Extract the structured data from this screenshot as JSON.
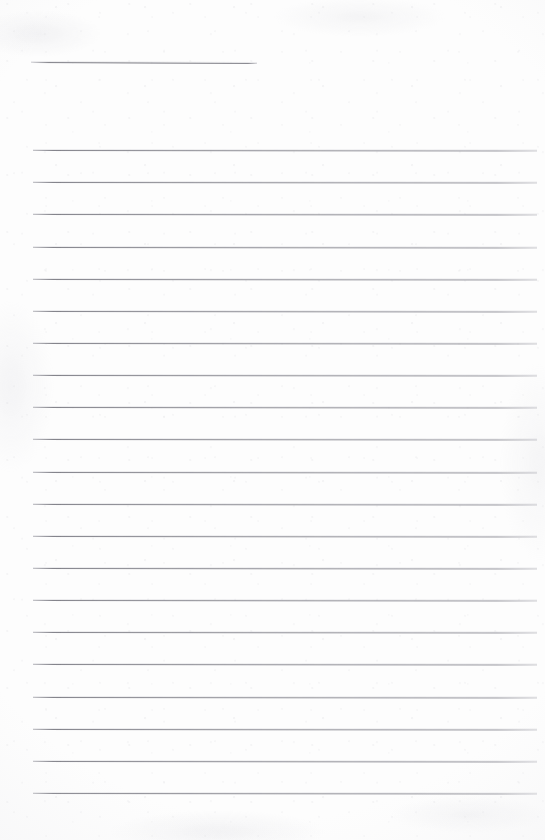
{
  "document": {
    "kind": "lined-paper-sheet",
    "title": "",
    "page_width": 545,
    "page_height": 840,
    "background_color": "#fdfdfd",
    "rule_color": "#85858d",
    "has_text_content": false,
    "note": ""
  },
  "layout": {
    "left_margin_x": 33,
    "right_margin_x": 537,
    "line_spacing": 32.15,
    "first_ruled_line_y": 150,
    "last_ruled_line_y": 793,
    "ruled_line_count": 21
  },
  "header_rule": {
    "label": "name-line",
    "x": 31,
    "y": 62,
    "width": 226,
    "tilt_degrees": 0.26
  },
  "ruled_lines": [
    {
      "index": 1,
      "y": 150.0,
      "x": 33,
      "width": 504
    },
    {
      "index": 2,
      "y": 182.2,
      "x": 33,
      "width": 504
    },
    {
      "index": 3,
      "y": 214.3,
      "x": 33,
      "width": 504
    },
    {
      "index": 4,
      "y": 246.5,
      "x": 33,
      "width": 504
    },
    {
      "index": 5,
      "y": 278.6,
      "x": 33,
      "width": 504
    },
    {
      "index": 6,
      "y": 310.8,
      "x": 33,
      "width": 504
    },
    {
      "index": 7,
      "y": 342.9,
      "x": 33,
      "width": 504
    },
    {
      "index": 8,
      "y": 375.1,
      "x": 33,
      "width": 504
    },
    {
      "index": 9,
      "y": 407.2,
      "x": 33,
      "width": 504
    },
    {
      "index": 10,
      "y": 439.4,
      "x": 33,
      "width": 504
    },
    {
      "index": 11,
      "y": 471.5,
      "x": 33,
      "width": 504
    },
    {
      "index": 12,
      "y": 503.7,
      "x": 33,
      "width": 504
    },
    {
      "index": 13,
      "y": 535.8,
      "x": 33,
      "width": 504
    },
    {
      "index": 14,
      "y": 568.0,
      "x": 33,
      "width": 504
    },
    {
      "index": 15,
      "y": 600.1,
      "x": 33,
      "width": 504
    },
    {
      "index": 16,
      "y": 632.3,
      "x": 33,
      "width": 504
    },
    {
      "index": 17,
      "y": 664.4,
      "x": 33,
      "width": 504
    },
    {
      "index": 18,
      "y": 696.6,
      "x": 33,
      "width": 504
    },
    {
      "index": 19,
      "y": 728.7,
      "x": 33,
      "width": 504
    },
    {
      "index": 20,
      "y": 760.9,
      "x": 33,
      "width": 504
    },
    {
      "index": 21,
      "y": 793.0,
      "x": 33,
      "width": 504
    }
  ]
}
